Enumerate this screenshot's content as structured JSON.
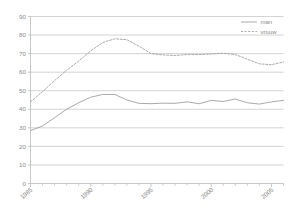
{
  "chart_data": {
    "type": "line",
    "title": "",
    "subtitle": "",
    "xlabel": "",
    "ylabel": "",
    "xlim": [
      1985,
      2006
    ],
    "ylim": [
      0,
      90
    ],
    "grid": true,
    "legend_position": "top-right",
    "y_ticks": [
      0,
      10,
      20,
      30,
      40,
      50,
      60,
      70,
      80,
      90
    ],
    "y_tick_labels": [
      "0",
      "10",
      "20",
      "30",
      "40",
      "50",
      "60",
      "70",
      "80",
      "90"
    ],
    "x_ticks": [
      1985,
      1986,
      1987,
      1988,
      1989,
      1990,
      1991,
      1992,
      1993,
      1994,
      1995,
      1996,
      1997,
      1998,
      1999,
      2000,
      2001,
      2002,
      2003,
      2004,
      2005,
      2006
    ],
    "x_tick_labels_major": [
      "1985",
      "1990",
      "1995",
      "2000",
      "2005"
    ],
    "x_major_values": [
      1985,
      1990,
      1995,
      2000,
      2005
    ],
    "x": [
      1985,
      1986,
      1987,
      1988,
      1989,
      1990,
      1991,
      1992,
      1993,
      1994,
      1995,
      1996,
      1997,
      1998,
      1999,
      2000,
      2001,
      2002,
      2003,
      2004,
      2005,
      2006
    ],
    "series": [
      {
        "name": "man",
        "style": "solid",
        "color": "#9a9a9a",
        "values": [
          28.5,
          31.0,
          35.5,
          40.0,
          43.5,
          46.5,
          48.0,
          48.0,
          45.0,
          43.2,
          43.0,
          43.3,
          43.2,
          44.0,
          43.0,
          44.8,
          44.2,
          45.5,
          43.5,
          42.8,
          44.0,
          44.8
        ]
      },
      {
        "name": "vrouw",
        "style": "dashed",
        "color": "#9a9a9a",
        "values": [
          44.0,
          49.5,
          55.5,
          61.0,
          66.0,
          71.5,
          76.0,
          78.0,
          77.5,
          74.0,
          70.0,
          69.3,
          69.0,
          69.5,
          69.5,
          69.8,
          70.2,
          69.5,
          67.0,
          64.5,
          64.0,
          65.5
        ]
      }
    ]
  },
  "legend": {
    "items": [
      {
        "label": "man",
        "style": "solid"
      },
      {
        "label": "vrouw",
        "style": "dashed"
      }
    ]
  },
  "colors": {
    "line": "#9a9a9a",
    "grid": "#b5b5b5",
    "axis": "#b0b0b0",
    "text": "#8a8a8a",
    "background": "#ffffff"
  }
}
